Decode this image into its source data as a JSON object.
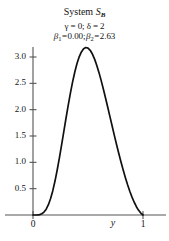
{
  "chart_data": {
    "type": "line",
    "title_main": "System ",
    "title_symbol": "S",
    "title_symbol_sub": "B",
    "subtitle_line1_gamma": "γ = 0; δ = 2",
    "subtitle_line2_beta": "β₁ = 0.00; β₂ = 2.63",
    "parameters": {
      "gamma_label": "γ",
      "gamma_value": "0",
      "delta_label": "δ",
      "delta_value": "2",
      "beta1_label": "β",
      "beta1_sub": "1",
      "beta1_value": "0.00",
      "beta2_label": "β",
      "beta2_sub": "2",
      "beta2_value": "2.63"
    },
    "xlabel": "y",
    "ylabel": "",
    "xlim": [
      -0.05,
      1.18
    ],
    "ylim": [
      0,
      3.45
    ],
    "xticks": [
      0,
      1
    ],
    "xtick_labels": [
      "0",
      "1"
    ],
    "yticks": [
      0.5,
      1.0,
      1.5,
      2.0,
      2.5,
      3.0
    ],
    "ytick_labels": [
      "0.5",
      "1.0",
      "1.5",
      "2.0",
      "2.5",
      "3.0"
    ],
    "grid": false,
    "legend": "none",
    "line_color": "#111111",
    "axis_color": "#555555",
    "curve_peak_x": 0.5,
    "curve_peak_y": 3.18,
    "x": [
      0.0,
      0.02,
      0.04,
      0.06,
      0.08,
      0.1,
      0.12,
      0.14,
      0.16,
      0.18,
      0.2,
      0.22,
      0.24,
      0.26,
      0.28,
      0.3,
      0.32,
      0.34,
      0.36,
      0.38,
      0.4,
      0.42,
      0.44,
      0.46,
      0.48,
      0.5,
      0.52,
      0.54,
      0.56,
      0.58,
      0.6,
      0.62,
      0.64,
      0.66,
      0.68,
      0.7,
      0.72,
      0.74,
      0.76,
      0.78,
      0.8,
      0.82,
      0.84,
      0.86,
      0.88,
      0.9,
      0.92,
      0.94,
      0.96,
      0.98,
      1.0
    ],
    "y": [
      0.0,
      0.0,
      0.001,
      0.005,
      0.016,
      0.038,
      0.076,
      0.134,
      0.214,
      0.317,
      0.442,
      0.586,
      0.745,
      0.914,
      1.087,
      1.26,
      1.428,
      1.587,
      1.733,
      1.862,
      1.972,
      2.06,
      2.124,
      2.165,
      2.181,
      2.174,
      2.145,
      2.096,
      2.03,
      1.948,
      1.854,
      1.75,
      1.638,
      1.521,
      1.4,
      1.278,
      1.155,
      1.034,
      0.915,
      0.8,
      0.69,
      0.585,
      0.486,
      0.394,
      0.31,
      0.233,
      0.166,
      0.108,
      0.061,
      0.025,
      0.0
    ]
  },
  "axes": {
    "y_axis_name": "vertical-axis",
    "x_axis_name": "horizontal-axis"
  }
}
